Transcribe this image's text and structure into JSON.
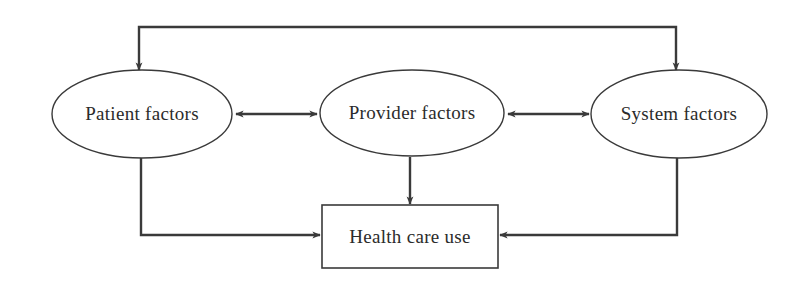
{
  "diagram": {
    "background_color": "#ffffff",
    "stroke_color": "#3a3a3a",
    "text_color": "#2b2b2b",
    "nodes": [
      {
        "id": "patient-factors",
        "label": "Patient factors",
        "shape": "ellipse",
        "cx": 142,
        "cy": 114,
        "rx": 90,
        "ry": 44
      },
      {
        "id": "provider-factors",
        "label": "Provider factors",
        "shape": "ellipse",
        "cx": 412,
        "cy": 113,
        "rx": 92,
        "ry": 43
      },
      {
        "id": "system-factors",
        "label": "System factors",
        "shape": "ellipse",
        "cx": 679,
        "cy": 114,
        "rx": 88,
        "ry": 44
      },
      {
        "id": "health-care-use",
        "label": "Health care use",
        "shape": "rectangle",
        "x": 322,
        "y": 205,
        "width": 176,
        "height": 63
      }
    ],
    "edges": [
      {
        "id": "patient-provider",
        "from": "patient-factors",
        "to": "provider-factors",
        "type": "bidirectional",
        "path": "horizontal"
      },
      {
        "id": "provider-system",
        "from": "provider-factors",
        "to": "system-factors",
        "type": "bidirectional",
        "path": "horizontal"
      },
      {
        "id": "system-patient-top",
        "from": "system-factors",
        "to": "patient-factors",
        "type": "bidirectional",
        "path": "top-routed"
      },
      {
        "id": "provider-health-care-use",
        "from": "provider-factors",
        "to": "health-care-use",
        "type": "directional",
        "path": "vertical"
      },
      {
        "id": "patient-health-care-use",
        "from": "patient-factors",
        "to": "health-care-use",
        "type": "directional",
        "path": "bottom-left-routed"
      },
      {
        "id": "system-health-care-use",
        "from": "system-factors",
        "to": "health-care-use",
        "type": "directional",
        "path": "bottom-right-routed"
      }
    ]
  }
}
